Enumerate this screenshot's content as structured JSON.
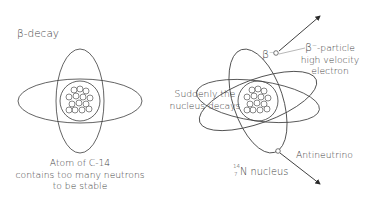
{
  "title": "β-decay",
  "left_atom": {
    "middle_label_line1": "Suddenly the",
    "middle_label_line2": "nucleus decays",
    "caption_line1": "Atom of C-14",
    "caption_line2": "contains too many neutrons",
    "caption_line3": "to be stable"
  },
  "right_atom": {
    "beta_symbol": "β",
    "beta_charge": "−",
    "beta_label_symbol": "β",
    "beta_label_charge": "−",
    "beta_label_rest": "-particle",
    "beta_desc_line2": "high velocity",
    "beta_desc_line3": "electron",
    "nucleus_mass_number": "14",
    "nucleus_atomic_number": "7",
    "nucleus_element": "N",
    "nucleus_label": " nucleus",
    "antineutrino_label": "Antineutrino"
  },
  "colors": {
    "line": "#3c3c3c",
    "leader": "#9a9a9a",
    "text": "#444444"
  }
}
